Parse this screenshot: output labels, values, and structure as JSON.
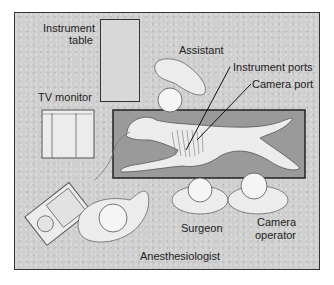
{
  "figure": {
    "labels": {
      "instrument_table_line1": "Instrument",
      "instrument_table_line2": "table",
      "tv_monitor": "TV monitor",
      "assistant": "Assistant",
      "instrument_ports": "Instrument ports",
      "camera_port": "Camera port",
      "surgeon": "Surgeon",
      "camera_operator_line1": "Camera",
      "camera_operator_line2": "operator",
      "anesthesiologist": "Anesthesiologist"
    },
    "colors": {
      "background": "#cfcfcf",
      "outline": "#333333",
      "table_fill": "#9a9a9a",
      "figure_fill": "#ececec"
    }
  }
}
